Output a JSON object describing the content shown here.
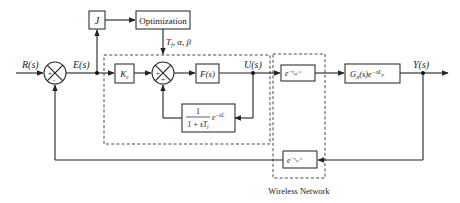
{
  "diagram": {
    "type": "control-block-diagram",
    "signals": {
      "reference": "R(s)",
      "error": "E(s)",
      "control": "U(s)",
      "output": "Y(s)"
    },
    "blocks": {
      "performance_index": "J",
      "optimization": "Optimization",
      "optimization_output": "T_f, α, β",
      "gain": "K_c",
      "filter": "F(s)",
      "internal_feedback_num": "1",
      "internal_feedback_den": "1 + sT_i",
      "internal_feedback_delay": "e^{-sL}",
      "ca_delay": "e^{-τ_ca s}",
      "plant": "G_n(s)e^{-sL_p}",
      "sc_delay": "e^{-τ_sc s}"
    },
    "summing_junctions": [
      {
        "id": "sum1",
        "signs": [
          "+",
          "-"
        ]
      },
      {
        "id": "sum2",
        "signs": [
          "+",
          "+"
        ]
      }
    ],
    "groups": {
      "wireless_network_label": "Wireless Network"
    }
  }
}
